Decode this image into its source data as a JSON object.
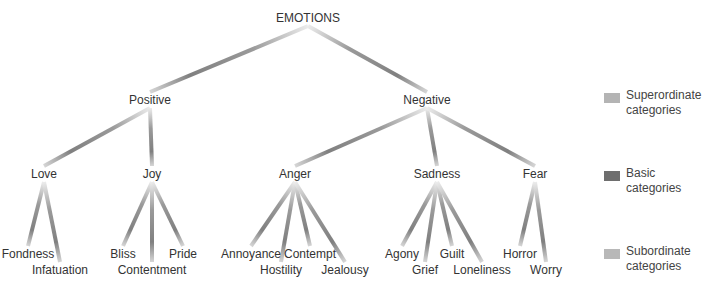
{
  "title": "EMOTIONS",
  "levels": {
    "superordinate": [
      "Positive",
      "Negative"
    ],
    "basic": [
      "Love",
      "Joy",
      "Anger",
      "Sadness",
      "Fear"
    ],
    "subordinate": {
      "Love": [
        "Fondness",
        "Infatuation"
      ],
      "Joy": [
        "Bliss",
        "Contentment",
        "Pride"
      ],
      "Anger": [
        "Annoyance",
        "Hostility",
        "Contempt",
        "Jealousy"
      ],
      "Sadness": [
        "Agony",
        "Grief",
        "Guilt",
        "Loneliness"
      ],
      "Fear": [
        "Horror",
        "Worry"
      ]
    }
  },
  "nodes": {
    "root": {
      "label": "EMOTIONS",
      "x": 308,
      "y": 18
    },
    "positive": {
      "label": "Positive",
      "x": 150,
      "y": 100
    },
    "negative": {
      "label": "Negative",
      "x": 427,
      "y": 100
    },
    "love": {
      "label": "Love",
      "x": 44,
      "y": 174
    },
    "joy": {
      "label": "Joy",
      "x": 152,
      "y": 174
    },
    "anger": {
      "label": "Anger",
      "x": 295,
      "y": 174
    },
    "sadness": {
      "label": "Sadness",
      "x": 437,
      "y": 174
    },
    "fear": {
      "label": "Fear",
      "x": 535,
      "y": 174
    },
    "fondness": {
      "label": "Fondness",
      "x": 28,
      "y": 254
    },
    "infatuation": {
      "label": "Infatuation",
      "x": 60,
      "y": 270
    },
    "bliss": {
      "label": "Bliss",
      "x": 123,
      "y": 254
    },
    "contentment": {
      "label": "Contentment",
      "x": 152,
      "y": 270
    },
    "pride": {
      "label": "Pride",
      "x": 183,
      "y": 254
    },
    "annoyance": {
      "label": "Annoyance",
      "x": 251,
      "y": 254
    },
    "hostility": {
      "label": "Hostility",
      "x": 281,
      "y": 270
    },
    "contempt": {
      "label": "Contempt",
      "x": 310,
      "y": 254
    },
    "jealousy": {
      "label": "Jealousy",
      "x": 345,
      "y": 270
    },
    "agony": {
      "label": "Agony",
      "x": 402,
      "y": 254
    },
    "grief": {
      "label": "Grief",
      "x": 425,
      "y": 270
    },
    "guilt": {
      "label": "Guilt",
      "x": 452,
      "y": 254
    },
    "loneliness": {
      "label": "Loneliness",
      "x": 482,
      "y": 270
    },
    "horror": {
      "label": "Horror",
      "x": 520,
      "y": 254
    },
    "worry": {
      "label": "Worry",
      "x": 546,
      "y": 270
    }
  },
  "legend": [
    {
      "label": "Superordinate\ncategories",
      "line1": "Superordinate",
      "line2": "categories",
      "color": "#b4b4b4"
    },
    {
      "label": "Basic\ncategories",
      "line1": "Basic",
      "line2": "categories",
      "color": "#6e6e6e"
    },
    {
      "label": "Subordinate\ncategories",
      "line1": "Subordinate",
      "line2": "categories",
      "color": "#b8b8b8"
    }
  ],
  "colors": {
    "edge_light": "#e6e6e6",
    "edge_dark": "#7a7a7a",
    "text": "#333333"
  }
}
